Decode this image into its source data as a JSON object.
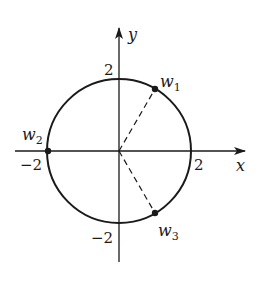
{
  "figure": {
    "axes": {
      "x_label": "x",
      "y_label": "y",
      "x_ticks": [
        {
          "value": -2,
          "label": "−2"
        },
        {
          "value": 2,
          "label": "2"
        }
      ],
      "y_ticks": [
        {
          "value": 2,
          "label": "2"
        },
        {
          "value": -2,
          "label": "−2"
        }
      ]
    },
    "circle": {
      "center": [
        0,
        0
      ],
      "radius": 2
    },
    "points": [
      {
        "name": "w",
        "subscript": "1",
        "angle_deg": 60,
        "dashed_to_origin": true
      },
      {
        "name": "w",
        "subscript": "2",
        "angle_deg": 180,
        "dashed_to_origin": false
      },
      {
        "name": "w",
        "subscript": "3",
        "angle_deg": -60,
        "dashed_to_origin": true
      }
    ]
  },
  "labels": {
    "x_axis": "x",
    "y_axis": "y",
    "tick_x_neg": "−2",
    "tick_x_pos": "2",
    "tick_y_pos": "2",
    "tick_y_neg": "−2",
    "w1_base": "w",
    "w1_sub": "1",
    "w2_base": "w",
    "w2_sub": "2",
    "w3_base": "w",
    "w3_sub": "3"
  },
  "colors": {
    "ink": "#1a1a1a",
    "background": "#ffffff"
  }
}
